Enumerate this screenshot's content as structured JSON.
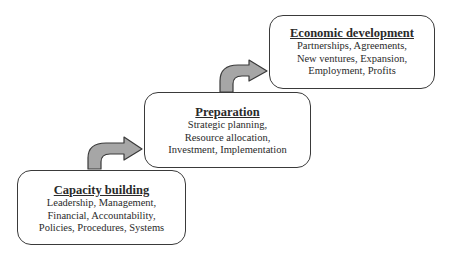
{
  "diagram": {
    "type": "staircase-process",
    "steps": [
      {
        "title": "Capacity building",
        "lines": [
          "Leadership, Management,",
          "Financial, Accountability,",
          "Policies, Procedures, Systems"
        ]
      },
      {
        "title": "Preparation",
        "lines": [
          "Strategic planning,",
          "Resource allocation,",
          "Investment, Implementation"
        ]
      },
      {
        "title": "Economic development",
        "lines": [
          "Partnerships, Agreements,",
          "New ventures, Expansion,",
          "Employment, Profits"
        ]
      }
    ],
    "arrows": [
      {
        "from": "Capacity building",
        "to": "Preparation",
        "icon": "curved-arrow-right-icon"
      },
      {
        "from": "Preparation",
        "to": "Economic development",
        "icon": "curved-arrow-right-icon"
      }
    ],
    "colors": {
      "arrow_fill": "#a6a6a6",
      "arrow_stroke": "#3a3a3a",
      "box_border": "#3a3a3a",
      "text": "#2a2a2a",
      "background": "#ffffff"
    }
  }
}
